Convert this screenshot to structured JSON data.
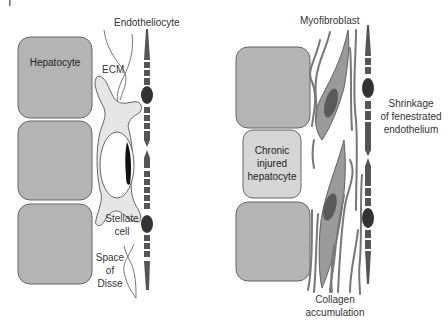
{
  "panels": {
    "normal": {
      "hepatocyte_label": "Hepatocyte",
      "labels": {
        "endotheliocyte": "Endotheliocyte",
        "ecm": "ECM",
        "stellate_line1": "Stellate",
        "stellate_line2": "cell",
        "disse_line1": "Space",
        "disse_line2": "of",
        "disse_line3": "Disse"
      }
    },
    "fibrotic": {
      "injured_line1": "Chronic",
      "injured_line2": "injured",
      "injured_line3": "hepatocyte",
      "labels": {
        "myofibroblast": "Myofibroblast",
        "shrink_line1": "Shrinkage",
        "shrink_line2": "of fenestrated",
        "shrink_line3": "endothelium",
        "collagen_line1": "Collagen",
        "collagen_line2": "accumulation"
      }
    }
  },
  "colors": {
    "hepatocyte": "#b4b4b4",
    "injured_hepatocyte": "#d6d6d6",
    "stellate": "#e6e6e6",
    "endothelium": "#5a5a5a",
    "myofibroblast": "#9a9a9a",
    "nucleus": "#444444"
  }
}
